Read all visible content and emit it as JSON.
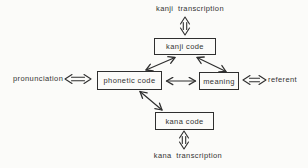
{
  "diagram": {
    "boxes": {
      "kanji_code": {
        "label": "kanji code"
      },
      "phonetic_code": {
        "label": "phonetic code"
      },
      "meaning": {
        "label": "meaning"
      },
      "kana_code": {
        "label": "kana code"
      }
    },
    "external_labels": {
      "kanji_transcription": "kanji transcription",
      "pronunciation": "pronunciation",
      "referent": "referent",
      "kana_transcription": "kana transcription"
    },
    "connections": [
      {
        "from": "kanji transcription",
        "to": "kanji code",
        "style": "open-double-arrow",
        "direction": "bidirectional"
      },
      {
        "from": "pronunciation",
        "to": "phonetic code",
        "style": "open-double-arrow",
        "direction": "bidirectional"
      },
      {
        "from": "referent",
        "to": "meaning",
        "style": "open-double-arrow",
        "direction": "bidirectional"
      },
      {
        "from": "kana transcription",
        "to": "kana code",
        "style": "open-double-arrow",
        "direction": "bidirectional"
      },
      {
        "from": "kanji code",
        "to": "phonetic code",
        "style": "thin-double-arrow",
        "direction": "bidirectional"
      },
      {
        "from": "kanji code",
        "to": "meaning",
        "style": "thin-double-arrow",
        "direction": "bidirectional"
      },
      {
        "from": "phonetic code",
        "to": "meaning",
        "style": "thin-double-arrow",
        "direction": "bidirectional"
      },
      {
        "from": "phonetic code",
        "to": "kana code",
        "style": "thin-double-arrow",
        "direction": "bidirectional"
      }
    ],
    "colors": {
      "line": "#2f2f2f",
      "text": "#333333",
      "background": "#fbfbf9"
    }
  }
}
